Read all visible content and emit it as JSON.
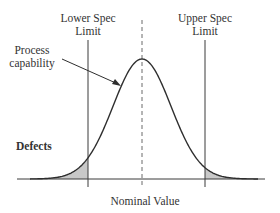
{
  "labels": {
    "lower_spec_line1": "Lower Spec",
    "lower_spec_line2": "Limit",
    "upper_spec_line1": "Upper Spec",
    "upper_spec_line2": "Limit",
    "process_line1": "Process",
    "process_line2": "capability",
    "defects": "Defects",
    "nominal": "Nominal Value"
  },
  "colors": {
    "line": "#3a3a3a",
    "shade": "#c8c8c8",
    "dashed": "#6a6a6a"
  },
  "geometry": {
    "baseline_y": 179,
    "axis_x_start": 17,
    "axis_x_end": 265,
    "lsl_x": 88,
    "usl_x": 205,
    "nominal_x": 142,
    "peak_y": 59,
    "sigma_px": 29
  }
}
